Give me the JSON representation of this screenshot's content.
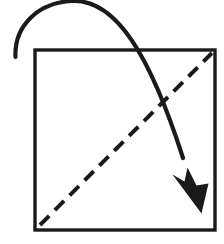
{
  "figure": {
    "description": "A square sheet with a dashed diagonal fold line running from the bottom-left corner to the top-right corner, and a curved solid arrow sweeping from the upper-left, over the top edge, down to the lower-right, indicating the direction the corner is folded.",
    "background_color": "#ffffff",
    "ink_color": "#1a1a1a"
  },
  "canvas": {
    "width": 224,
    "height": 244
  },
  "paper": {
    "name": "square-sheet",
    "shape": "square",
    "x": 35,
    "y": 50,
    "width": 180,
    "height": 180,
    "stroke_width": 3.4,
    "stroke_color": "#1a1a1a",
    "fill_color": "#ffffff",
    "corners": {
      "top_left": [
        35,
        50
      ],
      "top_right": [
        215,
        50
      ],
      "bottom_right": [
        215,
        230
      ],
      "bottom_left": [
        35,
        230
      ]
    }
  },
  "fold_line": {
    "name": "diagonal-fold-line",
    "style": "dashed",
    "meaning": "fold crease",
    "path": "M 40 225 L 212 53",
    "stroke_width": 4.0,
    "stroke_color": "#1a1a1a",
    "dash_length": 13,
    "gap_length": 8,
    "dash_array": "13 8",
    "from": [
      40,
      225
    ],
    "to": [
      212,
      53
    ]
  },
  "motion_arrow": {
    "name": "fold-direction-arrow",
    "style": "solid curved",
    "meaning": "direction of fold motion",
    "shaft_path": "M 15.5 57 C 14 26 38 2.5 72 1 C 116 -1 150 55 183 158",
    "stroke_width": 4.2,
    "stroke_color": "#1a1a1a",
    "tail_point": [
      15.5,
      57
    ],
    "apex_point": [
      72,
      1
    ],
    "tip_point": [
      201,
      212
    ],
    "head_fill": "#1a1a1a",
    "head_path": "M 201.5 213.5 L 172.5 174.5 L 184.5 181.5 L 187.5 167.5 L 196.5 185.5 L 208.5 183.5 Z",
    "head_length": 46,
    "head_width": 36
  },
  "annotations": {
    "fold_line_label": "valley fold crease",
    "arrow_label": "fold this corner down and across"
  }
}
